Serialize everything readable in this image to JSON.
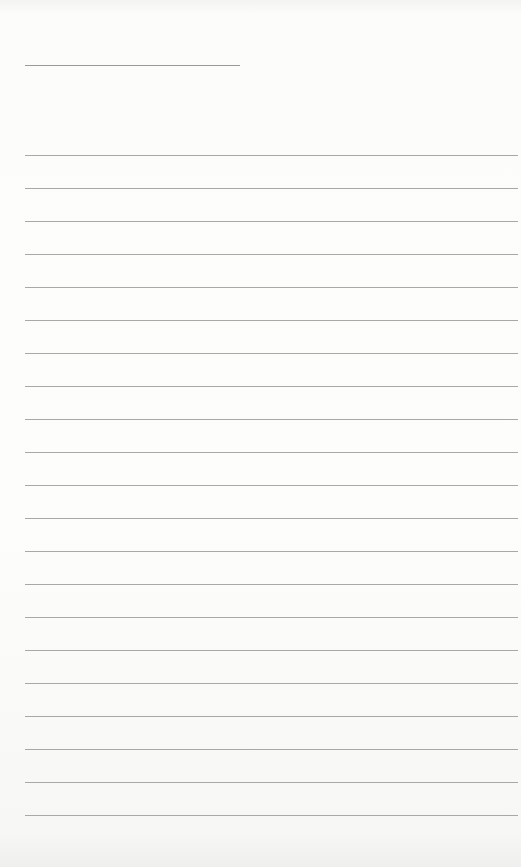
{
  "page": {
    "type": "lined-paper",
    "background_color": "#fbfbfa",
    "line_color": "#a8a8a8",
    "title_line": {
      "x": 25,
      "y": 65,
      "width": 215
    },
    "rules": {
      "count": 21,
      "first_y": 155,
      "spacing": 33,
      "x": 25,
      "width": 493
    }
  }
}
